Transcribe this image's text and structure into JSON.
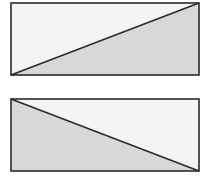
{
  "canvas": {
    "width": 213,
    "height": 179,
    "background": "#ffffff"
  },
  "colors": {
    "light_fill": "#f4f4f4",
    "shaded_fill": "#d8d8d8",
    "stroke": "#2a2a2a"
  },
  "diagrams": [
    {
      "id": "rect-ascending",
      "rect": {
        "x": 11,
        "y": 3,
        "width": 188,
        "height": 72
      },
      "diagonal": "bottom-left-to-top-right",
      "shaded_region": "lower-right triangle"
    },
    {
      "id": "rect-descending",
      "rect": {
        "x": 11,
        "y": 99,
        "width": 188,
        "height": 72
      },
      "diagonal": "top-left-to-bottom-right",
      "shaded_region": "lower-left triangle"
    }
  ]
}
